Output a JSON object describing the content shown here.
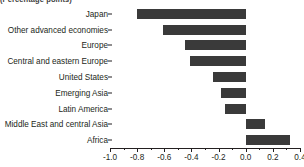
{
  "title": "(Percentage points)",
  "chart_data": {
    "type": "bar",
    "orientation": "horizontal",
    "title": "(Percentage points)",
    "xlabel": "",
    "ylabel": "",
    "xlim": [
      -1.0,
      0.4
    ],
    "grid": false,
    "legend": "none",
    "bar_color": "#3a3a3a",
    "axis_color": "#231f20",
    "categories": [
      "Japan",
      "Other advanced economies",
      "Europe",
      "Central and eastern Europe",
      "United States",
      "Emerging Asia",
      "Latin America",
      "Middle East and central Asia",
      "Africa"
    ],
    "values": [
      -0.8,
      -0.61,
      -0.45,
      -0.41,
      -0.24,
      -0.18,
      -0.15,
      0.14,
      0.33
    ],
    "xticks": [
      -1.0,
      -0.8,
      -0.6,
      -0.4,
      -0.2,
      0.0,
      0.2,
      0.4
    ],
    "xticklabels": [
      "-1.0",
      "-0.8",
      "-0.6",
      "-0.4",
      "-0.2",
      "0.0",
      "0.2",
      "0.4"
    ],
    "xminorticks": [
      -0.9,
      -0.7,
      -0.5,
      -0.3,
      -0.1,
      0.1,
      0.3
    ]
  }
}
